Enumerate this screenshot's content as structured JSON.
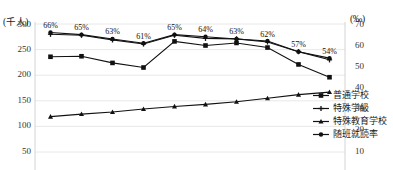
{
  "title": "",
  "axes": {
    "left_unit": "(千人)",
    "right_unit": "(‰)",
    "left_ticks": [
      "300",
      "250",
      "200",
      "150",
      "100",
      "50"
    ],
    "right_ticks": [
      "70",
      "60",
      "50",
      "40",
      "30",
      "20",
      "10"
    ]
  },
  "legend": {
    "items": [
      {
        "label": "普通学校",
        "marker": "square-marker-icon",
        "color": "#111111"
      },
      {
        "label": "特殊学級",
        "marker": "cross-marker-icon",
        "color": "#111111"
      },
      {
        "label": "特殊教育学校",
        "marker": "triangle-marker-icon",
        "color": "#111111"
      },
      {
        "label": "随班就読率",
        "marker": "diamond-marker-icon",
        "color": "#111111"
      }
    ]
  },
  "chart_data": {
    "type": "line",
    "title": "",
    "xlabel": "",
    "ylabel": "(千人)",
    "y2label": "(‰)",
    "ylim": [
      50,
      300
    ],
    "y2lim": [
      10,
      70
    ],
    "grid": true,
    "legend_position": "right",
    "categories": [
      "1",
      "2",
      "3",
      "4",
      "5",
      "6",
      "7",
      "8",
      "9",
      "10"
    ],
    "series": [
      {
        "name": "随班就読率",
        "axis": "right",
        "unit": "%",
        "values": [
          66,
          65,
          63,
          61,
          65,
          64,
          63,
          62,
          57,
          54
        ],
        "data_labels": [
          "66%",
          "65%",
          "63%",
          "61%",
          "65%",
          "64%",
          "63%",
          "62%",
          "57%",
          "54%"
        ],
        "marker": "diamond-marker-icon"
      },
      {
        "name": "普通学校",
        "axis": "left",
        "unit": "千人",
        "values": [
          236,
          237,
          224,
          215,
          266,
          258,
          263,
          254,
          221,
          196
        ],
        "marker": "square-marker-icon"
      },
      {
        "name": "特殊学級",
        "axis": "left",
        "unit": "千人",
        "values": [
          280,
          278,
          269,
          261,
          278,
          272,
          271,
          265,
          246,
          230
        ],
        "marker": "cross-marker-icon"
      },
      {
        "name": "特殊教育学校",
        "axis": "left",
        "unit": "千人",
        "values": [
          119,
          124,
          128,
          134,
          139,
          143,
          148,
          155,
          162,
          167
        ],
        "marker": "triangle-marker-icon"
      }
    ]
  }
}
